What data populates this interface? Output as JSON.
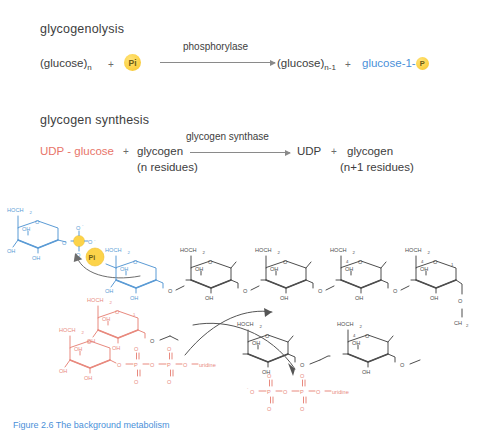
{
  "reaction_1": {
    "title": "glycogenolysis",
    "left_substrate": "(glucose)",
    "left_sub": "n",
    "plus_1": "+",
    "pi_label": "Pi",
    "enzyme": "phosphorylase",
    "right_product": "(glucose)",
    "right_sub": "n-1",
    "plus_2": "+",
    "right_product_2": "glucose-1-",
    "p_badge": "P"
  },
  "reaction_2": {
    "title": "glycogen synthesis",
    "left_substrate_1": "UDP - glucose",
    "plus_1": "+",
    "left_substrate_2": "glycogen",
    "left_note": "(n residues)",
    "enzyme": "glycogen synthase",
    "right_product_1": "UDP",
    "plus_2": "+",
    "right_product_2": "glycogen",
    "right_note": "(n+1  residues)"
  },
  "structures": {
    "labels": {
      "hoch2": "HOCH",
      "hoch2_sub": "2",
      "oh": "OH",
      "o": "O",
      "p": "P",
      "ch2": "CH",
      "ch2_sub": "2",
      "uridine": "uridine",
      "o_minus": "O",
      "pi_badge": "Pi",
      "carbon_4": "4",
      "carbon_1": "1",
      "carbon_6": "6"
    },
    "glucose_1_phosphate": {
      "name": "glucose-1-phosphate",
      "color": "#5b9bd5"
    },
    "glycogen_chain": {
      "name": "glycogen chain",
      "color": "#4d4d4d",
      "ring_count": 4
    },
    "udp_glucose": {
      "name": "UDP-glucose",
      "color": "#e8897e"
    },
    "udp_released": {
      "name": "UDP",
      "color": "#e8897e"
    }
  },
  "colors": {
    "blue": "#5b9bd5",
    "red": "#e8897e",
    "black": "#4d4d4d",
    "gold": "#fcd34a",
    "text": "#3d3d3d"
  },
  "caption": {
    "text": "Figure 2.6  The background metabolism"
  }
}
